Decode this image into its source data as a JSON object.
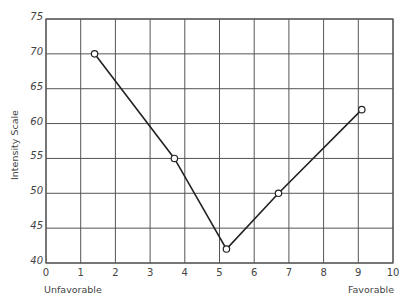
{
  "chart_data": {
    "type": "line",
    "title": "",
    "xlabel": "",
    "ylabel": "Intensity Scale",
    "x_anchor_labels": {
      "left": "Unfavorable",
      "right": "Favorable"
    },
    "xlim": [
      0,
      10
    ],
    "ylim": [
      40,
      75
    ],
    "x_ticks": [
      0,
      1,
      2,
      3,
      4,
      5,
      6,
      7,
      8,
      9,
      10
    ],
    "y_ticks": [
      40,
      45,
      50,
      55,
      60,
      65,
      70,
      75
    ],
    "grid": true,
    "legend": null,
    "series": [
      {
        "name": "Intensity",
        "marker": "open-circle",
        "x": [
          1.4,
          3.7,
          5.2,
          6.7,
          9.1
        ],
        "y": [
          70,
          55,
          42,
          50,
          62
        ]
      }
    ]
  },
  "labels": {
    "ylabel": "Intensity Scale",
    "unfavorable": "Unfavorable",
    "favorable": "Favorable"
  }
}
